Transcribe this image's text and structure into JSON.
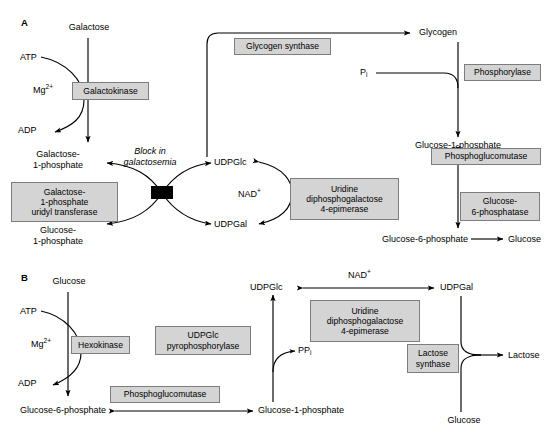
{
  "figure": {
    "background_color": "#ffffff",
    "line_color": "#000000",
    "enzyme_box_fill": "#d4d4d4",
    "enzyme_box_border": "#7d7d7d"
  },
  "panelA": {
    "label": "A",
    "metabolites": {
      "galactose": "Galactose",
      "atp": "ATP",
      "mg": "Mg",
      "mg_charge": "2+",
      "adp": "ADP",
      "galactose_1_phosphate_l1": "Galactose-",
      "galactose_1_phosphate_l2": "1-phosphate",
      "glucose_1_phosphate_l1": "Glucose-",
      "glucose_1_phosphate_l2": "1-phosphate",
      "udpglc": "UDPGlc",
      "udpgal": "UDPGal",
      "nad": "NAD",
      "nad_charge": "+",
      "glycogen": "Glycogen",
      "pi": "P",
      "pi_sub": "i",
      "glucose_1_phosphate_right": "Glucose-1-phosphate",
      "glucose_6_phosphate": "Glucose-6-phosphate",
      "glucose": "Glucose"
    },
    "annotations": {
      "block_line1": "Block in",
      "block_line2": "galactosemia"
    },
    "enzymes": {
      "galactokinase": "Galactokinase",
      "galactose_1_phosphate_uridyl_transferase_l1": "Galactose-",
      "galactose_1_phosphate_uridyl_transferase_l2": "1-phosphate",
      "galactose_1_phosphate_uridyl_transferase_l3": "uridyl transferase",
      "glycogen_synthase": "Glycogen synthase",
      "phosphorylase": "Phosphorylase",
      "phosphoglucomutase": "Phosphoglucomutase",
      "glucose_6_phosphatase_l1": "Glucose-",
      "glucose_6_phosphatase_l2": "6-phosphatase",
      "uridine_diphosphogalactose_4_epimerase_l1": "Uridine",
      "uridine_diphosphogalactose_4_epimerase_l2": "diphosphogalactose",
      "uridine_diphosphogalactose_4_epimerase_l3": "4-epimerase"
    }
  },
  "panelB": {
    "label": "B",
    "metabolites": {
      "glucose_top": "Glucose",
      "atp": "ATP",
      "mg": "Mg",
      "mg_charge": "2+",
      "adp": "ADP",
      "glucose_6_phosphate": "Glucose-6-phosphate",
      "glucose_1_phosphate": "Glucose-1-phosphate",
      "udpglc": "UDPGlc",
      "udpgal": "UDPGal",
      "nad": "NAD",
      "nad_charge": "+",
      "ppi": "PP",
      "ppi_sub": "i",
      "lactose": "Lactose",
      "glucose_bottom": "Glucose"
    },
    "enzymes": {
      "hexokinase": "Hexokinase",
      "udpglc_pyrophosphorylase_l1": "UDPGlc",
      "udpglc_pyrophosphorylase_l2": "pyrophosphorylase",
      "phosphoglucomutase": "Phosphoglucomutase",
      "uridine_diphosphogalactose_4_epimerase_l1": "Uridine",
      "uridine_diphosphogalactose_4_epimerase_l2": "diphosphogalactose",
      "uridine_diphosphogalactose_4_epimerase_l3": "4-epimerase",
      "lactose_synthase_l1": "Lactose",
      "lactose_synthase_l2": "synthase"
    }
  }
}
